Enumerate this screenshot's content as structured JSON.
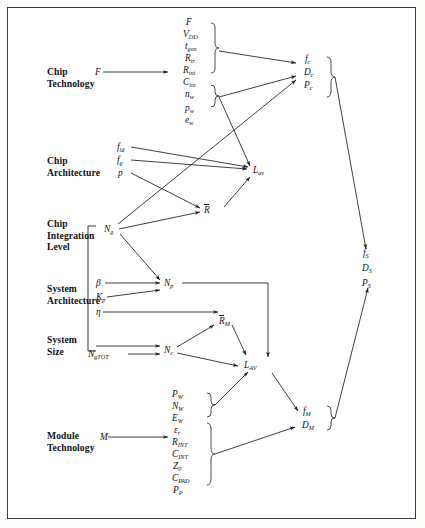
{
  "figure": {
    "type": "block-flow-diagram",
    "background": "#ffffff",
    "border_color": "#3a3a3a",
    "ink_color": "#1f1f1f"
  },
  "row_labels": [
    {
      "id": "chip-technology",
      "line1": "Chip",
      "line2": "Technology"
    },
    {
      "id": "chip-architecture",
      "line1": "Chip",
      "line2": "Architecture"
    },
    {
      "id": "chip-integration",
      "line1": "Chip",
      "line2": "Integration",
      "line3": "Level"
    },
    {
      "id": "system-architecture",
      "line1": "System",
      "line2": "Architecture"
    },
    {
      "id": "system-size",
      "line1": "System",
      "line2": "Size"
    },
    {
      "id": "module-technology",
      "line1": "Module",
      "line2": "Technology"
    }
  ],
  "inputs": {
    "chip_technology": "F",
    "module_technology": "M"
  },
  "chip_technology_params": [
    {
      "base": "F",
      "sub": ""
    },
    {
      "base": "V",
      "sub": "DD"
    },
    {
      "base": "t",
      "sub": "gox"
    },
    {
      "base": "R",
      "sub": "tr"
    },
    {
      "base": "R",
      "sub": "int",
      "script": "cal"
    },
    {
      "base": "C",
      "sub": "int",
      "script": "cal"
    },
    {
      "base": "n",
      "sub": "w"
    },
    {
      "base": "p",
      "sub": "w"
    },
    {
      "base": "e",
      "sub": "w"
    }
  ],
  "chip_architecture_params": [
    {
      "base": "f",
      "sub": "ld"
    },
    {
      "base": "f",
      "sub": "g"
    },
    {
      "base": "p",
      "sub": ""
    }
  ],
  "chip_integration_params": [
    {
      "base": "N",
      "sub": "g"
    }
  ],
  "system_architecture_params": [
    {
      "base": "β",
      "sub": ""
    },
    {
      "base": "K",
      "sub": "p"
    },
    {
      "base": "η",
      "sub": ""
    }
  ],
  "system_size_params": [
    {
      "base": "N",
      "sub": "gTOT"
    }
  ],
  "module_technology_params": [
    {
      "base": "P",
      "sub": "W"
    },
    {
      "base": "N",
      "sub": "W"
    },
    {
      "base": "E",
      "sub": "W"
    },
    {
      "base": "ε",
      "sub": "r"
    },
    {
      "base": "R",
      "sub": "INT",
      "script": "cal"
    },
    {
      "base": "C",
      "sub": "INT",
      "script": "cal"
    },
    {
      "base": "Z",
      "sub": "0"
    },
    {
      "base": "C",
      "sub": "PAD"
    },
    {
      "base": "P",
      "sub": "P"
    }
  ],
  "intermediates": [
    {
      "id": "L-av",
      "base": "L",
      "sub": "av",
      "overbar": false
    },
    {
      "id": "R-bar",
      "base": "R",
      "sub": "",
      "overbar": true
    },
    {
      "id": "N-p",
      "base": "N",
      "sub": "p",
      "overbar": false
    },
    {
      "id": "R-bar-M",
      "base": "R",
      "sub": "M",
      "overbar": true
    },
    {
      "id": "N-c",
      "base": "N",
      "sub": "c",
      "overbar": false
    },
    {
      "id": "L-AV",
      "base": "L",
      "sub": "AV",
      "overbar": false
    }
  ],
  "outputs": {
    "chip": [
      {
        "base": "f",
        "sub": "c"
      },
      {
        "base": "D",
        "sub": "c"
      },
      {
        "base": "P",
        "sub": "c"
      }
    ],
    "system": [
      {
        "base": "f",
        "sub": "S"
      },
      {
        "base": "D",
        "sub": "S"
      },
      {
        "base": "P",
        "sub": "S"
      }
    ],
    "module": [
      {
        "base": "f",
        "sub": "M"
      },
      {
        "base": "D",
        "sub": "M"
      }
    ]
  },
  "edges": [
    {
      "from": "F",
      "to": "chip-technology-params"
    },
    {
      "from": "chip-technology-params",
      "to": "chip-outputs"
    },
    {
      "from": "chip-technology-params-pw-ew",
      "to": "L-av"
    },
    {
      "from": "f-ld",
      "to": "L-av"
    },
    {
      "from": "f-g",
      "to": "L-av"
    },
    {
      "from": "p",
      "to": "R-bar"
    },
    {
      "from": "R-bar",
      "to": "L-av"
    },
    {
      "from": "N-g",
      "to": "R-bar"
    },
    {
      "from": "N-g",
      "to": "chip-outputs"
    },
    {
      "from": "N-g",
      "to": "N-p"
    },
    {
      "from": "beta",
      "to": "N-p"
    },
    {
      "from": "K-p",
      "to": "N-p"
    },
    {
      "from": "eta",
      "to": "R-bar-M"
    },
    {
      "from": "N-g-bracket",
      "to": "N-c"
    },
    {
      "from": "N-gTOT",
      "to": "N-c"
    },
    {
      "from": "N-c",
      "to": "R-bar-M"
    },
    {
      "from": "N-c",
      "to": "L-AV"
    },
    {
      "from": "R-bar-M",
      "to": "L-AV"
    },
    {
      "from": "N-p",
      "to": "L-AV"
    },
    {
      "from": "M",
      "to": "module-technology-params"
    },
    {
      "from": "module-params-top",
      "to": "L-AV"
    },
    {
      "from": "module-params-bottom",
      "to": "module-outputs"
    },
    {
      "from": "L-AV",
      "to": "module-outputs"
    },
    {
      "from": "chip-outputs",
      "to": "system-outputs"
    },
    {
      "from": "module-outputs",
      "to": "system-outputs"
    }
  ]
}
